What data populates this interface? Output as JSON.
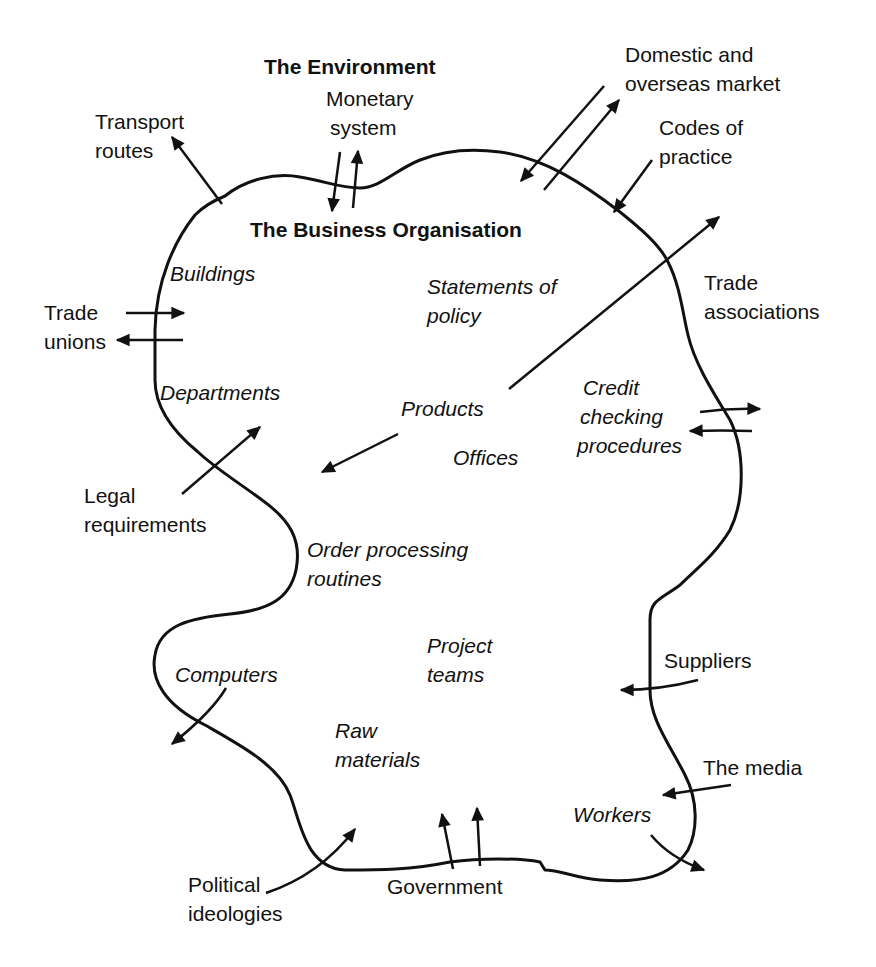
{
  "diagram": {
    "titles": {
      "environment": "The Environment",
      "organisation": "The Business Organisation"
    },
    "external_factors": [
      {
        "id": "transport",
        "lines": [
          "Transport",
          "routes"
        ],
        "x": 95,
        "y": 107,
        "flow": "outward"
      },
      {
        "id": "monetary",
        "lines": [
          "Monetary",
          "system"
        ],
        "x": 326,
        "y": 84,
        "flow": "both"
      },
      {
        "id": "market",
        "lines": [
          "Domestic and",
          "overseas market"
        ],
        "x": 625,
        "y": 40,
        "flow": "both"
      },
      {
        "id": "codes",
        "lines": [
          "Codes of",
          "practice"
        ],
        "x": 659,
        "y": 113,
        "flow": "inward"
      },
      {
        "id": "trade-associations",
        "lines": [
          "Trade",
          "associations"
        ],
        "x": 704,
        "y": 268,
        "flow": "outward"
      },
      {
        "id": "trade-unions",
        "lines": [
          "Trade",
          "unions"
        ],
        "x": 44,
        "y": 298,
        "flow": "both"
      },
      {
        "id": "legal",
        "lines": [
          "Legal",
          "requirements"
        ],
        "x": 84,
        "y": 481,
        "flow": "inward"
      },
      {
        "id": "suppliers",
        "lines": [
          "Suppliers"
        ],
        "x": 664,
        "y": 646,
        "flow": "inward"
      },
      {
        "id": "media",
        "lines": [
          "The media"
        ],
        "x": 703,
        "y": 753,
        "flow": "inward"
      },
      {
        "id": "political",
        "lines": [
          "Political",
          "ideologies"
        ],
        "x": 188,
        "y": 870,
        "flow": "inward"
      },
      {
        "id": "government",
        "lines": [
          "Government"
        ],
        "x": 387,
        "y": 872,
        "flow": "inward"
      }
    ],
    "internal_elements": [
      {
        "id": "buildings",
        "lines": [
          "Buildings"
        ],
        "x": 170,
        "y": 259
      },
      {
        "id": "statements",
        "lines": [
          "Statements of",
          "policy"
        ],
        "x": 427,
        "y": 272
      },
      {
        "id": "departments",
        "lines": [
          "Departments"
        ],
        "x": 160,
        "y": 378
      },
      {
        "id": "products",
        "lines": [
          "Products"
        ],
        "x": 401,
        "y": 394
      },
      {
        "id": "credit",
        "lines": [
          "Credit",
          "checking",
          "procedures"
        ],
        "x": 577,
        "y": 373
      },
      {
        "id": "offices",
        "lines": [
          "Offices"
        ],
        "x": 453,
        "y": 443
      },
      {
        "id": "order",
        "lines": [
          "Order processing",
          "routines"
        ],
        "x": 307,
        "y": 535
      },
      {
        "id": "project",
        "lines": [
          "Project",
          "teams"
        ],
        "x": 427,
        "y": 631
      },
      {
        "id": "computers",
        "lines": [
          "Computers"
        ],
        "x": 175,
        "y": 660
      },
      {
        "id": "raw",
        "lines": [
          "Raw",
          "materials"
        ],
        "x": 335,
        "y": 716
      },
      {
        "id": "workers",
        "lines": [
          "Workers"
        ],
        "x": 573,
        "y": 800
      }
    ],
    "colors": {
      "ink": "#111111",
      "background": "#ffffff"
    }
  }
}
